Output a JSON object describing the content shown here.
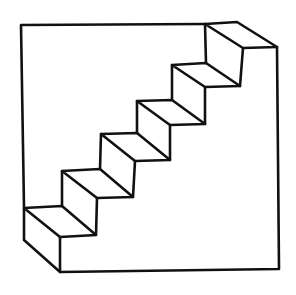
{
  "figure": {
    "stroke_color": "#111111",
    "background_color": "#ffffff",
    "outline": {
      "top_left": [
        21,
        25
      ],
      "top_end": [
        205,
        24
      ],
      "left_step_corner": [
        24,
        207
      ],
      "left_bottom": [
        24,
        240
      ],
      "bottom_front_left": [
        60,
        272
      ],
      "bottom_right": [
        279,
        269
      ],
      "right_top": [
        277,
        47
      ]
    },
    "steps": [
      {
        "back_left": [
          24,
          208
        ],
        "back_right": [
          62,
          206
        ],
        "front_right": [
          96,
          235
        ],
        "front_left": [
          60,
          237
        ]
      },
      {
        "back_left": [
          62,
          171
        ],
        "back_right": [
          100,
          169
        ],
        "front_right": [
          133,
          197
        ],
        "front_left": [
          97,
          198
        ]
      },
      {
        "back_left": [
          101,
          134
        ],
        "back_right": [
          137,
          133
        ],
        "front_right": [
          170,
          160
        ],
        "front_left": [
          135,
          161
        ]
      },
      {
        "back_left": [
          137,
          101
        ],
        "back_right": [
          172,
          100
        ],
        "front_right": [
          205,
          124
        ],
        "front_left": [
          170,
          125
        ]
      },
      {
        "back_left": [
          172,
          65
        ],
        "back_right": [
          206,
          63
        ],
        "front_right": [
          240,
          86
        ],
        "front_left": [
          205,
          87
        ]
      },
      {
        "back_left": [
          205,
          24
        ],
        "back_right": [
          237,
          22
        ],
        "front_right": [
          277,
          47
        ],
        "front_left": [
          243,
          48
        ]
      }
    ]
  }
}
